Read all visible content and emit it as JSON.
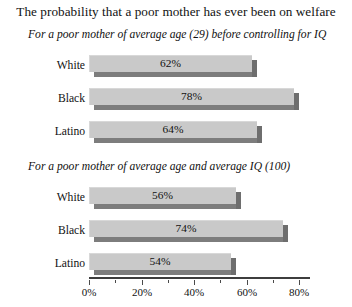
{
  "chart_data": {
    "type": "bar",
    "orientation": "horizontal",
    "title": "The probability that a poor mother has ever been on welfare",
    "xlabel": "",
    "ylabel": "",
    "xlim": [
      0,
      90
    ],
    "grid": false,
    "legend": null,
    "axis": {
      "major_ticks": [
        0,
        20,
        40,
        60,
        80
      ],
      "major_tick_labels": [
        "0%",
        "20%",
        "40%",
        "60%",
        "80%"
      ],
      "minor_ticks": [
        10,
        30,
        50,
        70
      ]
    },
    "panels": [
      {
        "subtitle": "For a poor mother of average age (29) before controlling for IQ",
        "categories": [
          "White",
          "Black",
          "Latino"
        ],
        "values": [
          62,
          78,
          64
        ],
        "value_labels": [
          "62%",
          "78%",
          "64%"
        ]
      },
      {
        "subtitle": "For a poor mother of average age and average IQ (100)",
        "categories": [
          "White",
          "Black",
          "Latino"
        ],
        "values": [
          56,
          74,
          54
        ],
        "value_labels": [
          "56%",
          "74%",
          "54%"
        ]
      }
    ],
    "colors": {
      "bar_face": "#c9c9c9",
      "bar_shadow": "#7d7d7d",
      "bar_side": "#6e6e6e",
      "text": "#111111",
      "axis": "#3d3d3d",
      "background": "#ffffff"
    }
  }
}
